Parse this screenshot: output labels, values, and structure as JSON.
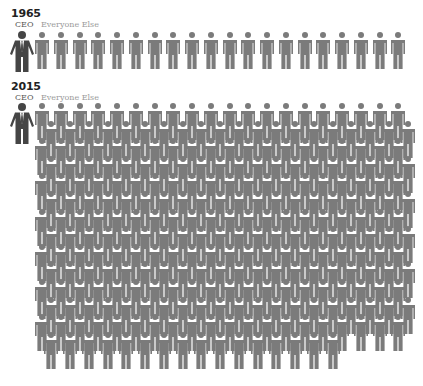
{
  "chart_data": {
    "type": "pictogram",
    "panels": [
      {
        "year": "1965",
        "ceo_label": "CEO",
        "others_label": "Everyone Else",
        "ceo_count": 1,
        "others_count": 20,
        "ratio": "20:1"
      },
      {
        "year": "2015",
        "ceo_label": "CEO",
        "others_label": "Everyone Else",
        "ceo_count": 1,
        "others_count": 276,
        "ratio": "276:1"
      }
    ],
    "layout": {
      "icons_per_row": 20,
      "rows_2015": 14,
      "last_row_count_2015": 16
    },
    "colors": {
      "ceo": "#454545",
      "others": "#7b7b7b",
      "year_text": "#222222",
      "ceo_label": "#555555",
      "others_label": "#9a9a9a"
    }
  },
  "panel_1965": {
    "year": "1965",
    "ceo_label": "CEO",
    "others_label": "Everyone Else",
    "others_count": 20
  },
  "panel_2015": {
    "year": "2015",
    "ceo_label": "CEO",
    "others_label": "Everyone Else",
    "others_count": 276
  }
}
